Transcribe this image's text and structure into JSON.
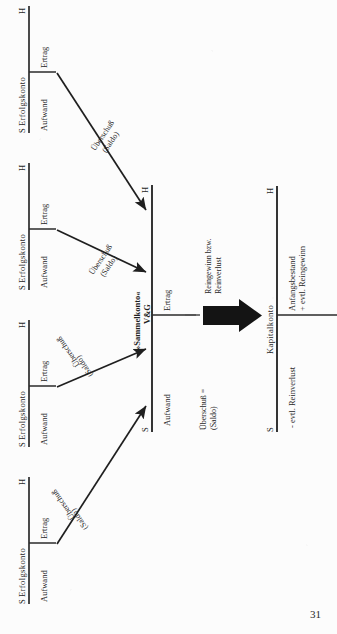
{
  "document": {
    "page_number": "31",
    "language": "de"
  },
  "accounts": {
    "erfolgskonto": {
      "title": "Erfolgskonto",
      "debit_side": "S",
      "credit_side": "H",
      "debit_item": "Aufwand",
      "credit_item": "Ertrag"
    },
    "sammelkonto": {
      "title_line1": "»Sammelkonto«",
      "title_line2": "V&G",
      "debit_side": "S",
      "credit_side": "H",
      "debit_item": "Aufwand",
      "credit_item": "Ertrag"
    },
    "kapitalkonto": {
      "title": "Kapitalkonto",
      "debit_side": "S",
      "credit_side": "H",
      "debit_item": "- evtl. Reinverlust",
      "credit_item_line1": "Anfangsbestand",
      "credit_item_line2": "+ evtl. Reingewinn"
    }
  },
  "flows": [
    {
      "id": "flow-1",
      "line1": "Überschuß",
      "line2": "(Saldo)",
      "source": "erfolgskonto-1",
      "target": "sammelkonto-credit"
    },
    {
      "id": "flow-2",
      "line1": "Überschuß",
      "line2": "(Saldo)",
      "source": "erfolgskonto-2",
      "target": "sammelkonto-credit"
    },
    {
      "id": "flow-3",
      "line1": "Überschuß",
      "line2": "(Saldo)",
      "source": "erfolgskonto-3",
      "target": "sammelkonto-debit"
    },
    {
      "id": "flow-4",
      "line1": "Überschuß",
      "line2": "(Saldo)",
      "source": "erfolgskonto-4",
      "target": "sammelkonto-debit"
    }
  ],
  "transfer": {
    "result_line1": "Reingewinn bzw.",
    "result_line2": "Reinverlust",
    "balance_line1": "Überschuß =",
    "balance_line2": "(Saldo)"
  },
  "colors": {
    "ink": "#1f1f1f",
    "rule": "#333333",
    "paper": "#fcfcfc"
  }
}
